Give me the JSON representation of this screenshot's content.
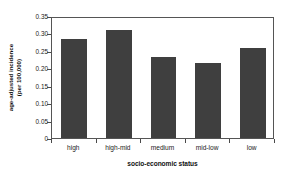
{
  "chart_data": {
    "type": "bar",
    "title": "",
    "xlabel": "socio-economic status",
    "ylabel_line1": "age-adjusted incidence",
    "ylabel_line2": "(per 100,000)",
    "categories": [
      "high",
      "high-mid",
      "medium",
      "mid-low",
      "low"
    ],
    "values": [
      0.283,
      0.31,
      0.233,
      0.216,
      0.257
    ],
    "ylim": [
      0,
      0.35
    ],
    "ytick_labels": [
      "0",
      "0.05",
      "0.10",
      "0.15",
      "0.20",
      "0.25",
      "0.30",
      "0.35"
    ],
    "ytick_values": [
      0,
      0.05,
      0.1,
      0.15,
      0.2,
      0.25,
      0.3,
      0.35
    ],
    "grid": false,
    "legend": "none",
    "bar_color": "#3f3f3f",
    "axis_color": "#555555",
    "background_color": "#ffffff"
  }
}
